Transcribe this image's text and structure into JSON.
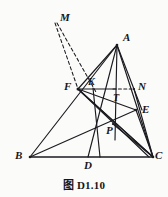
{
  "figure": {
    "caption": "图 D1.10",
    "kind": "euclidean-geometry-diagram",
    "line_color": "#1b1a1f",
    "label_color": "#17161a",
    "background": "#fbfbfa",
    "points": [
      {
        "id": "A",
        "label": "A",
        "x": 117,
        "y": 45,
        "label_x": 123,
        "label_y": 33
      },
      {
        "id": "B",
        "label": "B",
        "x": 30,
        "y": 157,
        "label_x": 15,
        "label_y": 150
      },
      {
        "id": "C",
        "label": "C",
        "x": 153,
        "y": 157,
        "label_x": 155,
        "label_y": 151
      },
      {
        "id": "D",
        "label": "D",
        "x": 88,
        "y": 157,
        "label_x": 84,
        "label_y": 161
      },
      {
        "id": "E",
        "label": "E",
        "x": 136,
        "y": 110,
        "label_x": 142,
        "label_y": 104
      },
      {
        "id": "F",
        "label": "F",
        "x": 78,
        "y": 89,
        "label_x": 66,
        "label_y": 82
      },
      {
        "id": "K",
        "label": "K",
        "x": 93,
        "y": 88,
        "label_x": 89,
        "label_y": 78
      },
      {
        "id": "M",
        "label": "M",
        "x": 55,
        "y": 23,
        "label_x": 60,
        "label_y": 13
      },
      {
        "id": "N",
        "label": "N",
        "x": 134,
        "y": 89,
        "label_x": 138,
        "label_y": 82
      },
      {
        "id": "P",
        "label": "P",
        "x": 113,
        "y": 124,
        "label_x": 108,
        "label_y": 127
      },
      {
        "id": "T",
        "label": "T",
        "x": 114,
        "y": 93,
        "label_x": 112,
        "label_y": 95
      }
    ],
    "solid_segments": [
      {
        "name": "side-AB",
        "from": "A",
        "to": "B"
      },
      {
        "name": "side-BC",
        "from": "B",
        "to": "C"
      },
      {
        "name": "side-CA",
        "from": "C",
        "to": "A"
      },
      {
        "name": "cevian-AD",
        "from": "A",
        "to": "D"
      },
      {
        "name": "cevian-BE",
        "from": "B",
        "to": "E"
      },
      {
        "name": "cevian-FC",
        "from": "F",
        "to": "C"
      },
      {
        "name": "segment-FE",
        "from": "F",
        "to": "E"
      },
      {
        "name": "segment-FN",
        "from": "F",
        "to": "N"
      },
      {
        "name": "segment-AN-extended",
        "from": "A",
        "to": "N"
      },
      {
        "name": "segment-NC",
        "from": "N",
        "to": "C"
      },
      {
        "name": "segment-FP-C",
        "from": "F",
        "to": "C"
      },
      {
        "name": "segment-EC",
        "from": "E",
        "to": "C"
      },
      {
        "name": "segment-KD",
        "from": "K",
        "to": "D"
      },
      {
        "name": "segment-F-to-lowerC",
        "from": "F",
        "to": "C"
      }
    ],
    "dashed_segments": [
      {
        "name": "dashed-MF",
        "from": "M",
        "to": "F"
      },
      {
        "name": "dashed-MK",
        "from": "M",
        "to": "K"
      },
      {
        "name": "dashed-TN",
        "from": "T",
        "to": "N"
      }
    ]
  }
}
